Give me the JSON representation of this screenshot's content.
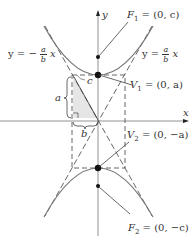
{
  "diagram": {
    "type": "hyperbola-vertical",
    "axes": {
      "x_label": "x",
      "y_label": "y"
    },
    "foci": [
      {
        "name": "F1",
        "label": "F",
        "sub": "1",
        "value": "= (0, c)"
      },
      {
        "name": "F2",
        "label": "F",
        "sub": "2",
        "value": "= (0, −c)"
      }
    ],
    "vertices": [
      {
        "name": "V1",
        "label": "V",
        "sub": "1",
        "value": "= (0, a)"
      },
      {
        "name": "V2",
        "label": "V",
        "sub": "2",
        "value": "= (0, −a)"
      }
    ],
    "asymptotes": {
      "left": {
        "prefix": "y = −",
        "num": "a",
        "den": "b",
        "suffix": "x"
      },
      "right": {
        "prefix": "y =",
        "num": "a",
        "den": "b",
        "suffix": "x"
      }
    },
    "triangle_labels": {
      "a": "a",
      "b": "b",
      "c": "c"
    },
    "colors": {
      "curve": "#6f6f6f",
      "axis": "#555555",
      "shade": "#e6e6e6",
      "dash": "#555555"
    }
  }
}
